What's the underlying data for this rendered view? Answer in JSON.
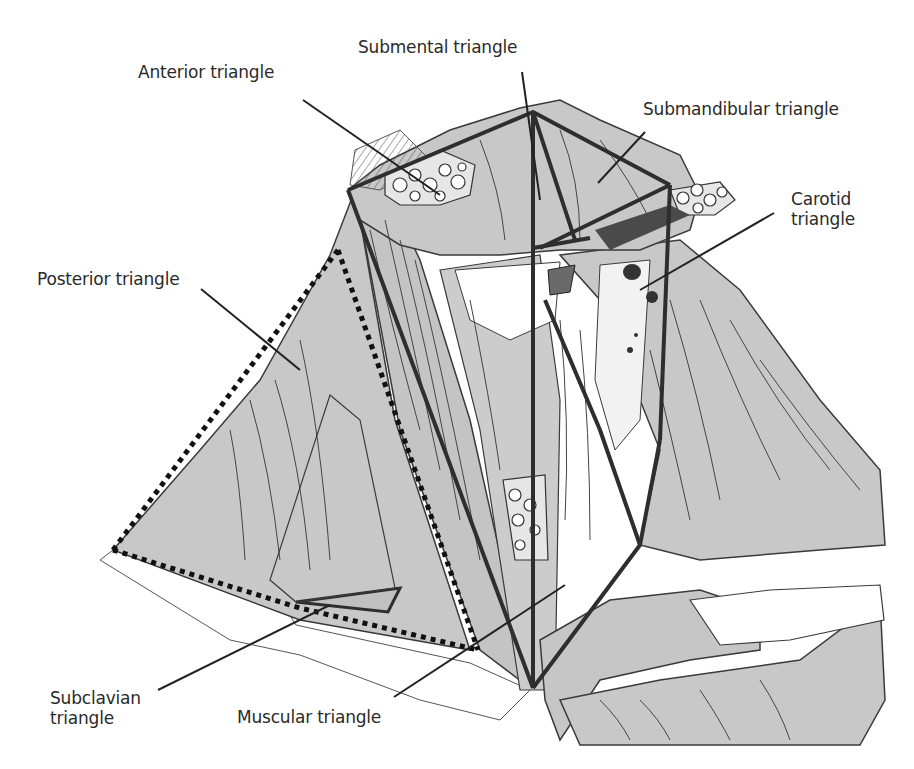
{
  "figure": {
    "colors": {
      "muscle_fill": "#c8c8c8",
      "muscle_line": "#3a3a3a",
      "boundary": "#2e2e2e",
      "background": "#ffffff",
      "dark_structure": "#4a4a4a"
    }
  },
  "labels": [
    {
      "id": "anterior",
      "text": "Anterior triangle",
      "x": 138,
      "y": 62
    },
    {
      "id": "submental",
      "text": "Submental triangle",
      "x": 358,
      "y": 37
    },
    {
      "id": "submandibular",
      "text": "Submandibular triangle",
      "x": 643,
      "y": 99
    },
    {
      "id": "carotid",
      "text": "Carotid\ntriangle",
      "x": 791,
      "y": 189
    },
    {
      "id": "posterior",
      "text": "Posterior triangle",
      "x": 37,
      "y": 269
    },
    {
      "id": "subclavian",
      "text": "Subclavian\ntriangle",
      "x": 50,
      "y": 688
    },
    {
      "id": "muscular",
      "text": "Muscular triangle",
      "x": 237,
      "y": 707
    }
  ]
}
